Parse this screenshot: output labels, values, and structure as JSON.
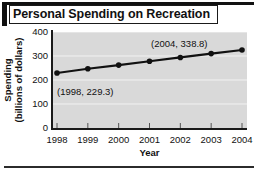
{
  "title": "Personal Spending on Recreation",
  "chart_data": {
    "type": "line",
    "title": "Personal Spending on Recreation",
    "xlabel": "Year",
    "ylabel": "Spending (billions of dollars)",
    "ylabel_line1": "Spending",
    "ylabel_line2": "(billions of dollars)",
    "categories": [
      1998,
      1999,
      2000,
      2001,
      2002,
      2003,
      2004
    ],
    "x_tick_labels": [
      "1998",
      "1999",
      "2000",
      "2001",
      "2002",
      "2003",
      "2004"
    ],
    "y_tick_labels": [
      "400",
      "300",
      "200",
      "100",
      "0"
    ],
    "y_ticks": [
      0,
      100,
      200,
      300,
      400
    ],
    "values": [
      229.3,
      247.0,
      262.0,
      278.0,
      294.0,
      310.0,
      325.0
    ],
    "values_display": [
      229.3,
      247.0,
      262.0,
      278.0,
      294.0,
      310.0,
      338.8
    ],
    "xlim": [
      1998,
      2004
    ],
    "ylim": [
      0,
      400
    ],
    "grid": true,
    "legend": "none",
    "marker": "circle",
    "line_color": "#111111",
    "marker_color": "#111111",
    "plot_background": "#d9d9d9",
    "gridline_color": "#f2f2f2",
    "annotations": [
      {
        "id": "first",
        "text": "(1998, 229.3)",
        "x": 1998,
        "y": 229.3
      },
      {
        "id": "last",
        "text": "(2004, 338.8)",
        "x": 2004,
        "y": 338.8
      }
    ]
  }
}
